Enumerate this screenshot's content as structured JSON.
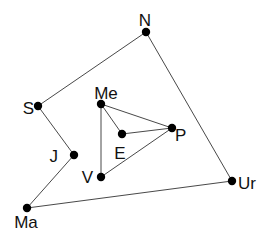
{
  "diagram": {
    "type": "graph",
    "background": "#ffffff",
    "edge_color": "#333333",
    "node_color": "#000000",
    "nodes": [
      {
        "id": "N",
        "label": "N",
        "x": 146,
        "y": 32,
        "lx": 145,
        "ly": 26,
        "anchor": "middle"
      },
      {
        "id": "S",
        "label": "S",
        "x": 38,
        "y": 106,
        "lx": 34,
        "ly": 114,
        "anchor": "end"
      },
      {
        "id": "Me",
        "label": "Me",
        "x": 101,
        "y": 104,
        "lx": 106,
        "ly": 99,
        "anchor": "middle"
      },
      {
        "id": "E",
        "label": "E",
        "x": 122,
        "y": 134,
        "lx": 120,
        "ly": 159,
        "anchor": "middle"
      },
      {
        "id": "P",
        "label": "P",
        "x": 172,
        "y": 128,
        "lx": 175,
        "ly": 141,
        "anchor": "start"
      },
      {
        "id": "J",
        "label": "J",
        "x": 74,
        "y": 155,
        "lx": 58,
        "ly": 162,
        "anchor": "end"
      },
      {
        "id": "V",
        "label": "V",
        "x": 101,
        "y": 177,
        "lx": 93,
        "ly": 183,
        "anchor": "end"
      },
      {
        "id": "Ur",
        "label": "Ur",
        "x": 232,
        "y": 181,
        "lx": 238,
        "ly": 189,
        "anchor": "start"
      },
      {
        "id": "Ma",
        "label": "Ma",
        "x": 27,
        "y": 208,
        "lx": 26,
        "ly": 228,
        "anchor": "middle"
      }
    ],
    "edges": [
      [
        "N",
        "S"
      ],
      [
        "S",
        "J"
      ],
      [
        "J",
        "Ma"
      ],
      [
        "Ma",
        "Ur"
      ],
      [
        "Ur",
        "N"
      ],
      [
        "Me",
        "P"
      ],
      [
        "Me",
        "E"
      ],
      [
        "Me",
        "V"
      ],
      [
        "E",
        "P"
      ],
      [
        "P",
        "V"
      ]
    ]
  }
}
